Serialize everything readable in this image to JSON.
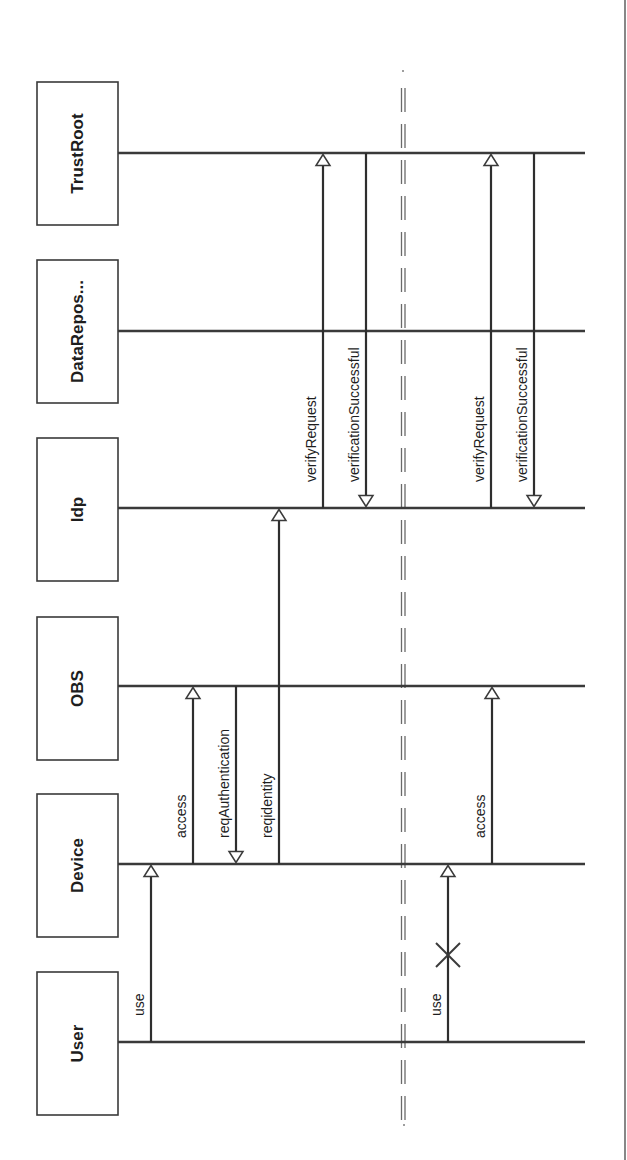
{
  "diagram": {
    "type": "sequence-diagram",
    "orientation": "rotated-90",
    "participants": [
      {
        "id": "trustroot",
        "label": "TrustRoot",
        "box_top": 82,
        "lifeline_y": 153
      },
      {
        "id": "datarepos",
        "label": "DataRepos...",
        "box_top": 260,
        "lifeline_y": 331
      },
      {
        "id": "idp",
        "label": "Idp",
        "box_top": 438,
        "lifeline_y": 508
      },
      {
        "id": "obs",
        "label": "OBS",
        "box_top": 617,
        "lifeline_y": 686
      },
      {
        "id": "device",
        "label": "Device",
        "box_top": 794,
        "lifeline_y": 864
      },
      {
        "id": "user",
        "label": "User",
        "box_top": 972,
        "lifeline_y": 1042
      }
    ],
    "messages": [
      {
        "id": "m1",
        "label": "use",
        "from": "user",
        "to": "device",
        "x": 151,
        "phase": 1,
        "failed": false
      },
      {
        "id": "m2",
        "label": "access",
        "from": "device",
        "to": "obs",
        "x": 193,
        "phase": 1,
        "failed": false
      },
      {
        "id": "m3",
        "label": "reqAuthentication",
        "from": "obs",
        "to": "device",
        "x": 236,
        "phase": 1,
        "failed": false
      },
      {
        "id": "m4",
        "label": "reqidentity",
        "from": "device",
        "to": "idp",
        "x": 279,
        "phase": 1,
        "failed": false
      },
      {
        "id": "m5",
        "label": "verifyRequest",
        "from": "idp",
        "to": "trustroot",
        "x": 323,
        "phase": 1,
        "failed": false
      },
      {
        "id": "m6",
        "label": "verificationSuccessful",
        "from": "trustroot",
        "to": "idp",
        "x": 366,
        "phase": 1,
        "failed": false
      },
      {
        "id": "m7",
        "label": "use",
        "from": "user",
        "to": "device",
        "x": 448,
        "phase": 2,
        "failed": true
      },
      {
        "id": "m8",
        "label": "access",
        "from": "device",
        "to": "obs",
        "x": 492,
        "phase": 2,
        "failed": false
      },
      {
        "id": "m9",
        "label": "verifyRequest",
        "from": "idp",
        "to": "trustroot",
        "x": 491,
        "phase": 2,
        "failed": false
      },
      {
        "id": "m10",
        "label": "verificationSuccessful",
        "from": "trustroot",
        "to": "idp",
        "x": 534,
        "phase": 2,
        "failed": false
      }
    ],
    "separator": {
      "style": "double-dashed",
      "x": 403
    },
    "colors": {
      "line": "#3a3a3a",
      "text": "#1e1e1e",
      "background": "#ffffff",
      "separator": "#6a6a6a"
    }
  }
}
